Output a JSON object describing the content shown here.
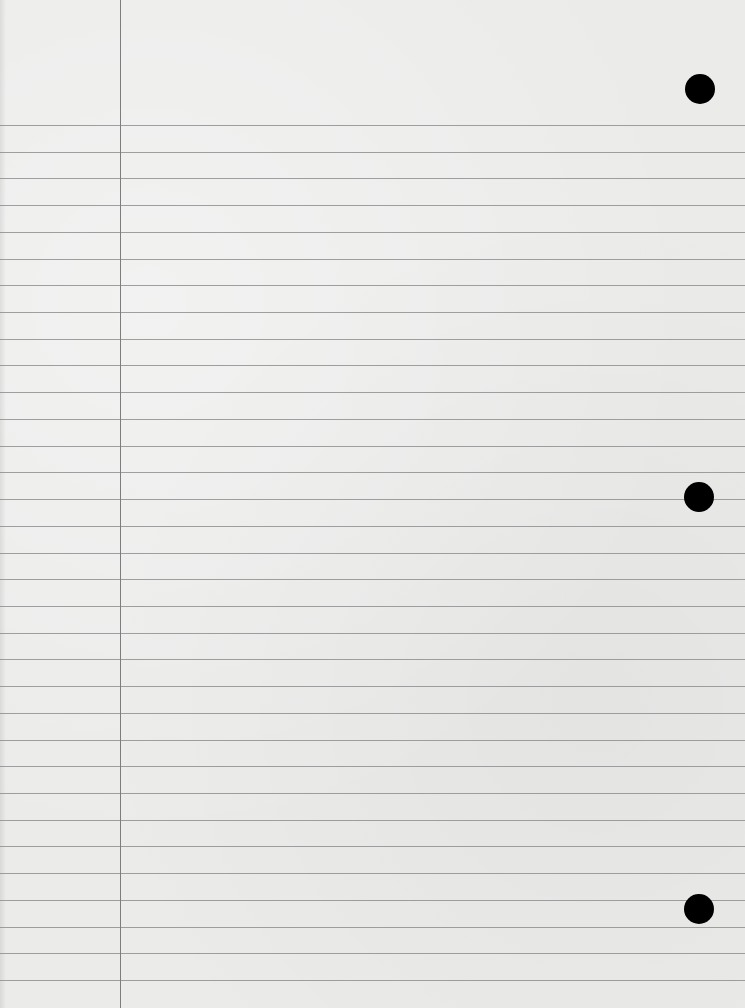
{
  "paper": {
    "type": "lined notebook paper",
    "background_color": "#ebebea",
    "rule_color": "#8f8f8f",
    "margin_line_color": "#7d7d7d",
    "first_rule_y": 125,
    "rule_spacing": 26.72,
    "rule_count": 33,
    "margin_line_x": 120,
    "holes": [
      {
        "cx": 700,
        "cy": 89,
        "r": 15
      },
      {
        "cx": 699,
        "cy": 497,
        "r": 15
      },
      {
        "cx": 699,
        "cy": 909,
        "r": 15
      }
    ],
    "text_content": ""
  }
}
